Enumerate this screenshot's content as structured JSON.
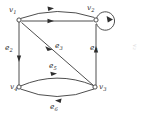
{
  "figure": {
    "stroke_color": "#3a3a3a",
    "arrow_color": "#2e2e2e",
    "background": "#ffffff",
    "vertices": [
      {
        "id": "v1",
        "label": "v",
        "sub": "1",
        "x": 19,
        "y": 20,
        "label_x": 10,
        "label_y": 6
      },
      {
        "id": "v2",
        "label": "v",
        "sub": "2",
        "x": 96,
        "y": 20,
        "label_x": 88,
        "label_y": 5
      },
      {
        "id": "v3",
        "label": "v",
        "sub": "3",
        "x": 95,
        "y": 87,
        "label_x": 99,
        "label_y": 83
      },
      {
        "id": "v4",
        "label": "v",
        "sub": "4",
        "x": 19,
        "y": 87,
        "label_x": 11,
        "label_y": 84
      }
    ],
    "edges": [
      {
        "id": "e1",
        "label": "e",
        "sub": "1",
        "from": "v1",
        "to": "v2",
        "shape": "arc-up",
        "labeled": false
      },
      {
        "id": "e1b",
        "label": "",
        "sub": "",
        "from": "v1",
        "to": "v2",
        "shape": "straight",
        "labeled": false
      },
      {
        "id": "e2",
        "label": "e",
        "sub": "2",
        "from": "v1",
        "to": "v4",
        "shape": "straight-vertical",
        "label_x": 6,
        "label_y": 47,
        "labeled": true
      },
      {
        "id": "e3",
        "label": "e",
        "sub": "3",
        "from": "v1",
        "to": "v3",
        "shape": "diagonal",
        "label_x": 56,
        "label_y": 45,
        "labeled": true
      },
      {
        "id": "e4",
        "label": "e",
        "sub": "4",
        "from": "v3",
        "to": "v2",
        "shape": "straight-vertical",
        "label_x": 91,
        "label_y": 47,
        "labeled": true
      },
      {
        "id": "e5",
        "label": "e",
        "sub": "5",
        "from": "v4",
        "to": "v3",
        "shape": "arc-up",
        "label_x": 50,
        "label_y": 65,
        "labeled": true
      },
      {
        "id": "e6",
        "label": "e",
        "sub": "6",
        "from": "v3",
        "to": "v4",
        "shape": "arc-down",
        "label_x": 51,
        "label_y": 104,
        "labeled": true
      },
      {
        "id": "loop",
        "label": "",
        "sub": "",
        "from": "v2",
        "to": "v2",
        "shape": "self-loop",
        "labeled": false
      }
    ],
    "side_note": "v₂"
  }
}
